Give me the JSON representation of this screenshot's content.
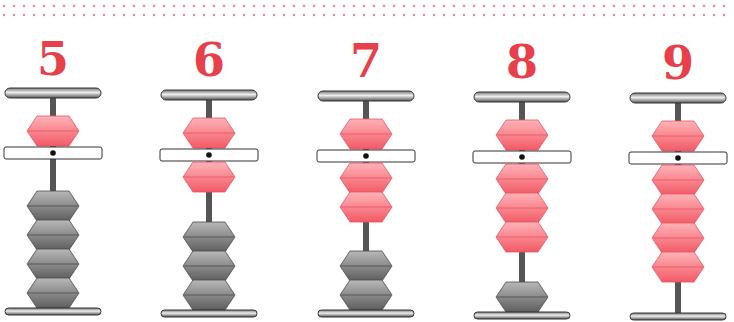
{
  "colors": {
    "numeral": "#e8404a",
    "dot": "#f08a98",
    "red_bead_top": "#ffb3b8",
    "red_bead_bottom": "#f25a66",
    "red_bead_edge": "#e85460",
    "gray_bead_top": "#b8b8b8",
    "gray_bead_bottom": "#5e5e5e",
    "gray_bead_edge": "#4a4a4a",
    "rod": "#555555",
    "beam_fill": "#ffffff",
    "beam_edge": "#333333"
  },
  "columns": [
    {
      "label": "5",
      "value": 5,
      "upper_active": true,
      "lower_active": 0,
      "lower_total": 4,
      "x": 3,
      "rail_top": 88,
      "beam_top": 147,
      "rail_bottom": 308
    },
    {
      "label": "6",
      "value": 6,
      "upper_active": true,
      "lower_active": 1,
      "lower_total": 4,
      "x": 159,
      "rail_top": 90,
      "beam_top": 149,
      "rail_bottom": 310
    },
    {
      "label": "7",
      "value": 7,
      "upper_active": true,
      "lower_active": 2,
      "lower_total": 4,
      "x": 316,
      "rail_top": 91,
      "beam_top": 150,
      "rail_bottom": 310
    },
    {
      "label": "8",
      "value": 8,
      "upper_active": true,
      "lower_active": 3,
      "lower_total": 4,
      "x": 472,
      "rail_top": 92,
      "beam_top": 151,
      "rail_bottom": 312
    },
    {
      "label": "9",
      "value": 9,
      "upper_active": true,
      "lower_active": 4,
      "lower_total": 4,
      "x": 628,
      "rail_top": 93,
      "beam_top": 152,
      "rail_bottom": 313
    }
  ]
}
